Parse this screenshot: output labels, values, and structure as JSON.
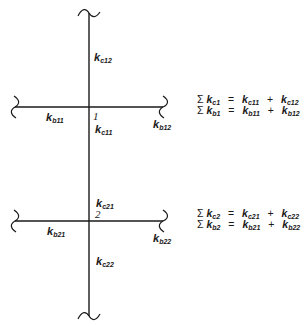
{
  "diagram": {
    "type": "structural-frame-joints",
    "members": {
      "column_upper": {
        "label": "k",
        "sub": "c12"
      },
      "column_mid_below_1": {
        "label": "k",
        "sub": "c11"
      },
      "column_mid_above_2": {
        "label": "k",
        "sub": "c21"
      },
      "column_lower": {
        "label": "k",
        "sub": "c22"
      },
      "beam_1_left": {
        "label": "k",
        "sub": "b11"
      },
      "beam_1_right": {
        "label": "k",
        "sub": "b12"
      },
      "beam_2_left": {
        "label": "k",
        "sub": "b21"
      },
      "beam_2_right": {
        "label": "k",
        "sub": "b22"
      }
    },
    "nodes": [
      {
        "id": "1",
        "label": "1"
      },
      {
        "id": "2",
        "label": "2"
      }
    ],
    "equations": [
      {
        "sigma": "Σ",
        "lhs_sub": "c1",
        "rhs1_sub": "c11",
        "rhs2_sub": "c12",
        "eq": "=",
        "plus": "+"
      },
      {
        "sigma": "Σ",
        "lhs_sub": "b1",
        "rhs1_sub": "b11",
        "rhs2_sub": "b12",
        "eq": "=",
        "plus": "+"
      },
      {
        "sigma": "Σ",
        "lhs_sub": "c2",
        "rhs1_sub": "c21",
        "rhs2_sub": "c22",
        "eq": "=",
        "plus": "+"
      },
      {
        "sigma": "Σ",
        "lhs_sub": "b2",
        "rhs1_sub": "b21",
        "rhs2_sub": "b22",
        "eq": "=",
        "plus": "+"
      }
    ],
    "k_symbol": "k"
  }
}
